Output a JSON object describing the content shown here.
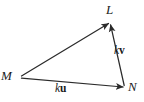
{
  "figure": {
    "type": "vector-triangle-diagram",
    "background_color": "#ffffff",
    "stroke_color": "#2b2b2b",
    "vertices": [
      {
        "id": "M",
        "label": "M",
        "x": 20,
        "y": 77
      },
      {
        "id": "L",
        "label": "L",
        "x": 110,
        "y": 22
      },
      {
        "id": "N",
        "label": "N",
        "x": 125,
        "y": 88
      }
    ],
    "vectors": [
      {
        "id": "ML",
        "from": "M",
        "to": "L",
        "arrowhead": "to",
        "label": "",
        "scalar": "",
        "vecname": ""
      },
      {
        "id": "MN",
        "from": "M",
        "to": "N",
        "arrowhead": "to",
        "label": "ku",
        "scalar": "k",
        "vecname": "u"
      },
      {
        "id": "NL",
        "from": "N",
        "to": "L",
        "arrowhead": "to",
        "label": "kv",
        "scalar": "k",
        "vecname": "v"
      }
    ],
    "labels": {
      "vertex_L": "L",
      "vertex_M": "M",
      "vertex_N": "N",
      "vector_ku_scalar": "k",
      "vector_ku_name": "u",
      "vector_kv_scalar": "k",
      "vector_kv_name": "v"
    }
  }
}
